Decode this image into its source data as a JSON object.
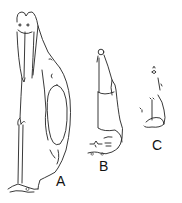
{
  "figure": {
    "labels": [
      {
        "id": "A",
        "text": "A"
      },
      {
        "id": "B",
        "text": "B"
      },
      {
        "id": "C",
        "text": "C"
      }
    ],
    "colors": {
      "line": "#222222",
      "background": "#ffffff"
    }
  }
}
